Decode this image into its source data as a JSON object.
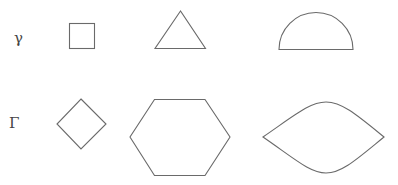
{
  "rows": [
    {
      "label": "γ",
      "shapes": [
        "square",
        "triangle",
        "semicircle"
      ]
    },
    {
      "label": "Γ",
      "shapes": [
        "diamond",
        "hexagon",
        "lens"
      ]
    }
  ],
  "colors": {
    "stroke": "#6a6a6a",
    "label": "#444444",
    "background": "#ffffff"
  }
}
